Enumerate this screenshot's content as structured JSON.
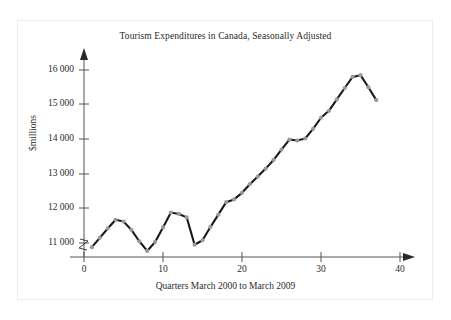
{
  "chart_data": {
    "type": "line",
    "title": "Tourism Expenditures in Canada, Seasonally Adjusted",
    "xlabel": "Quarters March 2000 to March 2009",
    "ylabel": "$millions",
    "xlim": [
      0,
      42
    ],
    "ylim": [
      10600,
      16400
    ],
    "xticks": [
      0,
      10,
      20,
      30,
      40
    ],
    "xtick_labels": [
      "0",
      "10",
      "20",
      "30",
      "40"
    ],
    "yticks": [
      11000,
      12000,
      13000,
      14000,
      15000,
      16000
    ],
    "ytick_labels": [
      "11 000",
      "12 000",
      "13 000",
      "14 000",
      "15 000",
      "16 000"
    ],
    "grid": false,
    "legend": null,
    "axis_break": "y-axis zigzag break below 11 000",
    "marker": "round gray points",
    "line_color": "#1b1b1b",
    "marker_color": "#9a9a9a",
    "axis_color": "#555555",
    "x": [
      1,
      2,
      3,
      4,
      5,
      6,
      7,
      8,
      9,
      10,
      11,
      12,
      13,
      14,
      15,
      16,
      17,
      18,
      19,
      20,
      21,
      22,
      23,
      24,
      25,
      26,
      27,
      28,
      29,
      30,
      31,
      32,
      33,
      34,
      35,
      36,
      37
    ],
    "values": [
      10880,
      11150,
      11420,
      11670,
      11620,
      11380,
      11050,
      10770,
      11030,
      11450,
      11880,
      11840,
      11740,
      10950,
      11080,
      11460,
      11820,
      12180,
      12260,
      12450,
      12700,
      12920,
      13150,
      13400,
      13700,
      13990,
      13960,
      14020,
      14300,
      14620,
      14820,
      15150,
      15480,
      15800,
      15850,
      15500,
      15130
    ],
    "series": [
      {
        "name": "Tourism expenditures",
        "values": [
          10880,
          11150,
          11420,
          11670,
          11620,
          11380,
          11050,
          10770,
          11030,
          11450,
          11880,
          11840,
          11740,
          10950,
          11080,
          11460,
          11820,
          12180,
          12260,
          12450,
          12700,
          12920,
          13150,
          13400,
          13700,
          13990,
          13960,
          14020,
          14300,
          14620,
          14820,
          15150,
          15480,
          15800,
          15850,
          15500,
          15130
        ]
      }
    ]
  }
}
